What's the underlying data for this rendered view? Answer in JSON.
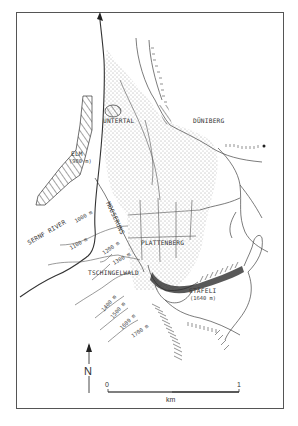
{
  "map": {
    "places": {
      "untertal": "UNTERTAL",
      "duniberg": "DÜNIBERG",
      "elm": "ELM",
      "elm_elev": "(980 m)",
      "sernf_river": "SERNF RIVER",
      "raminbach": "MOOSERUNS",
      "plattenberg": "PLATTENBERG",
      "tschingelwald": "TSCHINGELWALD",
      "stafeli": "STÄFELI",
      "stafeli_elev": "(1640 m)"
    },
    "contours": {
      "c1000": "1000 m",
      "c1100": "1100 m",
      "c1200": "1200 m",
      "c1300": "1300 m",
      "c1400": "1400 m",
      "c1500": "1500 m",
      "c1600": "1600 m",
      "c1700": "1700 m"
    },
    "north_arrow": {
      "label": "N"
    },
    "scale_bar": {
      "start": "0",
      "end": "1",
      "unit": "km"
    },
    "colors": {
      "ink": "#333333",
      "background": "#ffffff",
      "frame": "#555555"
    }
  }
}
